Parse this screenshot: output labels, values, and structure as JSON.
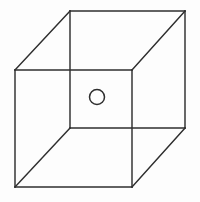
{
  "figure": {
    "title": "Wireframe Cube With Center Circle",
    "caption": "",
    "background_color": "#fdfdfd",
    "line_color": "#2e2e2e",
    "line_width": 1.45,
    "canvas": {
      "width": 200,
      "height": 202
    },
    "projection": "oblique-cabinet",
    "shape_name": "cube",
    "marker_name": "circle"
  },
  "chart_data": {
    "type": "diagram",
    "title": "Wireframe Cube With Center Circle",
    "xlabel": "",
    "ylabel": "",
    "grid": false,
    "legend": "none",
    "axis_ranges": {
      "x": [
        0,
        200
      ],
      "y": [
        0,
        202
      ]
    },
    "vertices": {
      "back_top_left": {
        "x": 70,
        "y": 11
      },
      "back_top_right": {
        "x": 185,
        "y": 11
      },
      "back_bottom_right": {
        "x": 185,
        "y": 128
      },
      "back_bottom_left": {
        "x": 70,
        "y": 128
      },
      "front_top_left": {
        "x": 15,
        "y": 70
      },
      "front_top_right": {
        "x": 132,
        "y": 70
      },
      "front_bottom_right": {
        "x": 132,
        "y": 187
      },
      "front_bottom_left": {
        "x": 15,
        "y": 187
      }
    },
    "edges": [
      {
        "name": "back-face-top",
        "x1": 70,
        "y1": 11,
        "x2": 185,
        "y2": 11
      },
      {
        "name": "back-face-right",
        "x1": 185,
        "y1": 11,
        "x2": 185,
        "y2": 128
      },
      {
        "name": "back-face-bottom",
        "x1": 185,
        "y1": 128,
        "x2": 70,
        "y2": 128
      },
      {
        "name": "back-face-left",
        "x1": 70,
        "y1": 128,
        "x2": 70,
        "y2": 11
      },
      {
        "name": "front-face-top",
        "x1": 15,
        "y1": 70,
        "x2": 132,
        "y2": 70
      },
      {
        "name": "front-face-right",
        "x1": 132,
        "y1": 70,
        "x2": 132,
        "y2": 187
      },
      {
        "name": "front-face-bottom",
        "x1": 132,
        "y1": 187,
        "x2": 15,
        "y2": 187
      },
      {
        "name": "front-face-left",
        "x1": 15,
        "y1": 187,
        "x2": 15,
        "y2": 70
      },
      {
        "name": "connector-top-left",
        "x1": 15,
        "y1": 70,
        "x2": 70,
        "y2": 11
      },
      {
        "name": "connector-top-right",
        "x1": 132,
        "y1": 70,
        "x2": 185,
        "y2": 11
      },
      {
        "name": "connector-bottom-right",
        "x1": 132,
        "y1": 187,
        "x2": 185,
        "y2": 128
      },
      {
        "name": "connector-bottom-left",
        "x1": 15,
        "y1": 187,
        "x2": 70,
        "y2": 128
      }
    ],
    "markers": [
      {
        "name": "center-circle",
        "shape": "circle",
        "cx": 97,
        "cy": 97,
        "r": 7.5,
        "filled": false
      }
    ],
    "annotations": []
  }
}
